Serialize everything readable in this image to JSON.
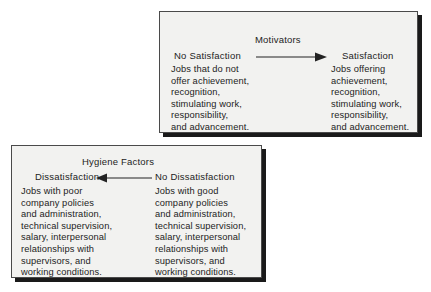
{
  "figure": {
    "background_color": "#ffffff",
    "panel_fill": "#f2f2f0",
    "panel_border_color": "#4a4a4a",
    "shadow_color": "#1a1a1a",
    "text_color": "#232323"
  },
  "motivators": {
    "heading": "Motivators",
    "arrow_direction": "right",
    "left": {
      "label": "No Satisfaction",
      "body": "Jobs that do not\noffer achievement,\nrecognition,\nstimulating work,\nresponsibility,\nand advancement."
    },
    "right": {
      "label": "Satisfaction",
      "body": "Jobs offering\nachievement,\nrecognition,\nstimulating work,\nresponsibility,\nand advancement."
    }
  },
  "hygiene": {
    "heading": "Hygiene Factors",
    "arrow_direction": "left",
    "left": {
      "label": "Dissatisfaction",
      "body": "Jobs with poor\ncompany policies\nand administration,\ntechnical supervision,\nsalary, interpersonal\nrelationships with\nsupervisors, and\nworking conditions."
    },
    "right": {
      "label": "No Dissatisfaction",
      "body": "Jobs with good\ncompany policies\nand administration,\ntechnical supervision,\nsalary, interpersonal\nrelationships with\nsupervisors, and\nworking conditions."
    }
  }
}
